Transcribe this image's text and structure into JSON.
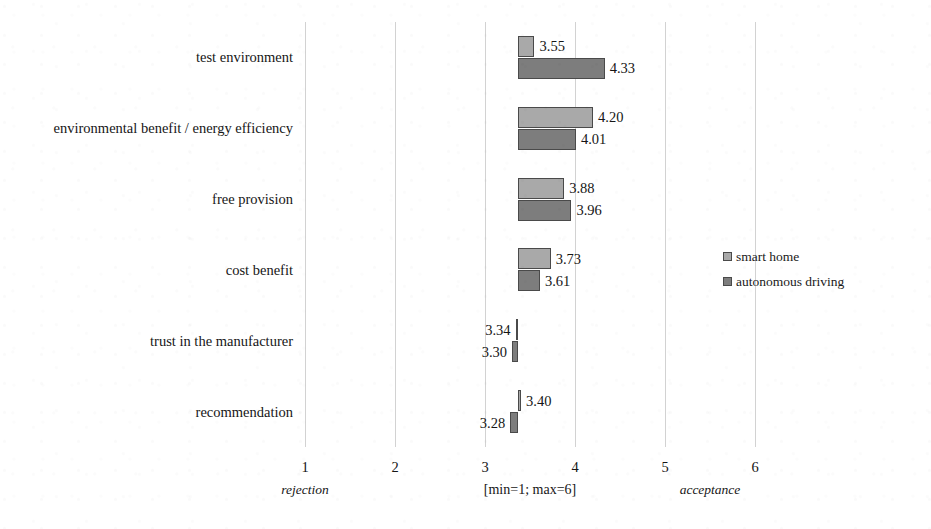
{
  "chart_data": {
    "type": "bar",
    "orientation": "horizontal",
    "title": "",
    "subtitle": "",
    "xlabel": "[min=1; max=6]",
    "ylabel": "",
    "xlim": [
      1,
      6
    ],
    "xticks": [
      "1",
      "2",
      "3",
      "4",
      "5",
      "6"
    ],
    "grid": true,
    "baseline_value": 3.37,
    "scale_note": "[min=1; max=6]",
    "axis_anchor_low": "rejection",
    "axis_anchor_high": "acceptance",
    "legend_position": "right",
    "categories": [
      "test environment",
      "environmental benefit / energy efficiency",
      "free provision",
      "cost benefit",
      "trust in the manufacturer",
      "recommendation"
    ],
    "series": [
      {
        "name": "smart home",
        "color": "#a9a9a9",
        "values": [
          3.55,
          4.2,
          3.88,
          3.73,
          3.34,
          3.4
        ],
        "labels": [
          "3.55",
          "4.20",
          "3.88",
          "3.73",
          "3.34",
          "3.40"
        ]
      },
      {
        "name": "autonomous driving",
        "color": "#7d7d7d",
        "values": [
          4.33,
          4.01,
          3.96,
          3.61,
          3.3,
          3.28
        ],
        "labels": [
          "4.33",
          "4.01",
          "3.96",
          "3.61",
          "3.30",
          "3.28"
        ]
      }
    ]
  },
  "legend": {
    "items": [
      {
        "label": "smart home",
        "color": "#a9a9a9"
      },
      {
        "label": "autonomous driving",
        "color": "#7d7d7d"
      }
    ]
  },
  "axis": {
    "ticks": [
      "1",
      "2",
      "3",
      "4",
      "5",
      "6"
    ],
    "low_anchor": "rejection",
    "high_anchor": "acceptance",
    "range_note": "[min=1; max=6]"
  },
  "colors": {
    "series_light": "#a9a9a9",
    "series_dark": "#7d7d7d",
    "gridline": "#d2d2d2",
    "bar_border": "#4a4a4a",
    "text": "#161616",
    "background": "#ffffff"
  }
}
